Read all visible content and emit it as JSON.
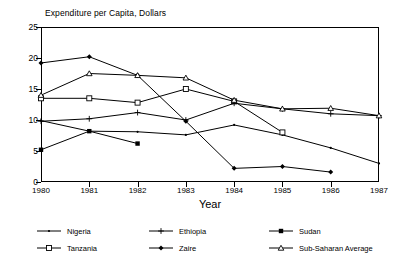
{
  "chart_data": {
    "type": "line",
    "title": "Expenditure per Capita, Dollars",
    "xlabel": "Year",
    "ylabel": "",
    "categories": [
      "1980",
      "1981",
      "1982",
      "1983",
      "1984",
      "1985",
      "1986",
      "1987"
    ],
    "x": [
      1980,
      1981,
      1982,
      1983,
      1984,
      1985,
      1986,
      1987
    ],
    "xlim": [
      1980,
      1987
    ],
    "ylim": [
      0,
      25
    ],
    "yticks": [
      0,
      5,
      10,
      15,
      20,
      25
    ],
    "grid": false,
    "legend_position": "bottom",
    "series": [
      {
        "name": "Nigeria",
        "marker": "dot",
        "x": [
          1980,
          1981,
          1982,
          1983,
          1984,
          1985,
          1986,
          1987
        ],
        "values": [
          9.9,
          8.2,
          8.1,
          7.6,
          9.2,
          7.6,
          5.5,
          3.0
        ]
      },
      {
        "name": "Tanzania",
        "marker": "open-square",
        "x": [
          1980,
          1981,
          1982,
          1983,
          1984,
          1985
        ],
        "values": [
          13.5,
          13.5,
          12.8,
          15.0,
          13.0,
          8.0
        ]
      },
      {
        "name": "Ethiopia",
        "marker": "plus",
        "x": [
          1980,
          1981,
          1982,
          1983,
          1984,
          1985,
          1986,
          1987
        ],
        "values": [
          9.8,
          10.2,
          11.2,
          10.0,
          12.7,
          11.8,
          11.0,
          10.7
        ]
      },
      {
        "name": "Zaire",
        "marker": "filled-diamond",
        "x": [
          1980,
          1981,
          1982,
          1983,
          1984,
          1985,
          1986
        ],
        "values": [
          19.2,
          20.2,
          17.2,
          9.8,
          2.2,
          2.5,
          1.6
        ]
      },
      {
        "name": "Sudan",
        "marker": "filled-square",
        "x": [
          1980,
          1981,
          1982
        ],
        "values": [
          5.2,
          8.2,
          6.2
        ]
      },
      {
        "name": "Sub-Saharan Average",
        "marker": "open-triangle",
        "x": [
          1980,
          1981,
          1982,
          1983,
          1984,
          1985,
          1986,
          1987
        ],
        "values": [
          14.0,
          17.5,
          17.2,
          16.8,
          13.2,
          11.8,
          11.9,
          10.7
        ]
      }
    ]
  },
  "colors": {
    "line": "#000000",
    "axis": "#000000",
    "background": "#ffffff"
  }
}
